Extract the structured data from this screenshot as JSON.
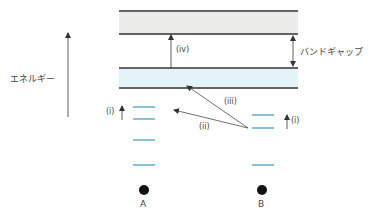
{
  "diagram": {
    "energy_label": "エネルギー",
    "band_gap_label": "バンドギャップ",
    "transitions": {
      "i": "(i)",
      "ii": "(ii)",
      "iii": "(iii)",
      "iv": "(iv)"
    },
    "impurity_A_label": "A",
    "impurity_B_label": "B",
    "colors": {
      "conduction_band_fill": "#ececea",
      "valence_band_fill": "#e4f3f8",
      "band_edge": "#333333",
      "level_line": "#4a9ec9",
      "arrow": "#333333",
      "dot": "#111111"
    }
  }
}
